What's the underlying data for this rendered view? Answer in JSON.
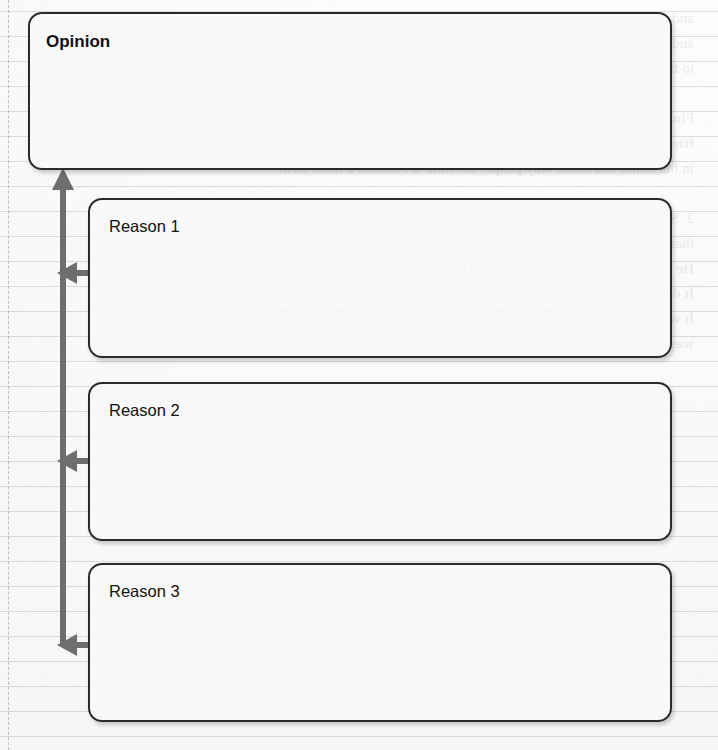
{
  "page": {
    "width": 718,
    "height": 750,
    "background_kind": "ruled-notebook-paper",
    "paper": {
      "rule_line_spacing_px": 25,
      "rule_line_color": "#78808"
    }
  },
  "colors": {
    "box_border": "#2b2b2b",
    "box_fill": "#f8f8f8",
    "box_shadow": "rgba(0,0,0,0.20)",
    "arrow": "#6e6e6e",
    "text": "#111111",
    "paper_background": "#fbfbfb",
    "rule_line": "#7880884",
    "margin_line": "#828a94"
  },
  "diagram": {
    "type": "opinion-reasons-organizer",
    "nodes": [
      {
        "id": "opinion",
        "label": "Opinion",
        "bold": true,
        "content": "",
        "x": 28,
        "y": 12,
        "width": 644,
        "height": 158
      },
      {
        "id": "reason-1",
        "label": "Reason 1",
        "bold": false,
        "content": "",
        "x": 88,
        "y": 198,
        "width": 584,
        "height": 160
      },
      {
        "id": "reason-2",
        "label": "Reason 2",
        "bold": false,
        "content": "",
        "x": 88,
        "y": 382,
        "width": 584,
        "height": 159
      },
      {
        "id": "reason-3",
        "label": "Reason 3",
        "bold": false,
        "content": "",
        "x": 88,
        "y": 563,
        "width": 584,
        "height": 159
      }
    ],
    "connector": {
      "name": "reasons-support-opinion-arrow",
      "description": "Vertical spine rising from the third reason to the Opinion box, with left-pointing arrowheads entering the spine from each Reason box",
      "stem_x": 63,
      "stem_top_y": 170,
      "stem_bottom_y": 645,
      "head_up": {
        "x": 63,
        "y": 170
      },
      "branches": [
        {
          "from": "reason-1",
          "y": 273,
          "from_x": 88,
          "to_x": 63
        },
        {
          "from": "reason-2",
          "y": 461,
          "from_x": 88,
          "to_x": 63
        },
        {
          "from": "reason-3",
          "y": 645,
          "from_x": 88,
          "to_x": 63
        }
      ]
    }
  },
  "bleed_through": {
    "visible": true,
    "opacity": 0.085,
    "text": "and every once in a while I make sure to check in with them\nand see how they are doing. This kind of attitude challenges me\nto be a better student.\n\nFinally, setting goals is a way we can all improve. My\nfriend, who is a great player, told me about who played a huge role\nin his mind, and in the way people see him. It's almost a habit now.\n\n2. Someone who introduces you, or decided to notice everything\nthat was different about him, saw a new side of the conversation.\nHe became a mentor. I know how to think about the topic for me.\nIt did not matter how we sat down though, hoping to stay in the future.\nIt was a relationship that lasted the whole year, and he noticed it. When it\nwas finally over, I was thankful for the chance."
  }
}
